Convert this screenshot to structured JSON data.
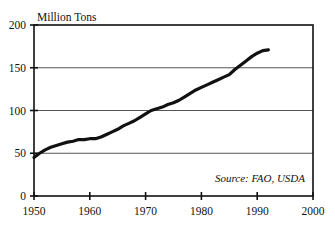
{
  "chart_data": {
    "type": "line",
    "title": "Million Tons",
    "xlabel": "",
    "ylabel": "Million Tons",
    "xlim": [
      1950,
      2000
    ],
    "ylim": [
      0,
      200
    ],
    "ytick_labels": [
      "0",
      "50",
      "100",
      "150",
      "200"
    ],
    "yticks": [
      0,
      50,
      100,
      150,
      200
    ],
    "xtick_labels": [
      "1950",
      "1960",
      "1970",
      "1980",
      "1990",
      "2000"
    ],
    "xticks": [
      1950,
      1960,
      1970,
      1980,
      1990,
      2000
    ],
    "grid": "horizontal",
    "legend": "none",
    "annotation": "Source: FAO, USDA",
    "line_color": "#111111",
    "line_width": 3.2,
    "series": [
      {
        "name": "World Production",
        "x": [
          1950,
          1951,
          1952,
          1953,
          1954,
          1955,
          1956,
          1957,
          1958,
          1959,
          1960,
          1961,
          1962,
          1963,
          1964,
          1965,
          1966,
          1967,
          1968,
          1969,
          1970,
          1971,
          1972,
          1973,
          1974,
          1975,
          1976,
          1977,
          1978,
          1979,
          1980,
          1981,
          1982,
          1983,
          1984,
          1985,
          1986,
          1987,
          1988,
          1989,
          1990,
          1991,
          1992
        ],
        "values": [
          45,
          50,
          54,
          57,
          59,
          61,
          63,
          64,
          66,
          66,
          67,
          67,
          69,
          72,
          75,
          78,
          82,
          85,
          88,
          92,
          96,
          100,
          102,
          104,
          107,
          109,
          112,
          116,
          120,
          124,
          127,
          130,
          133,
          136,
          139,
          142,
          148,
          153,
          158,
          163,
          167,
          170,
          171
        ]
      }
    ]
  }
}
